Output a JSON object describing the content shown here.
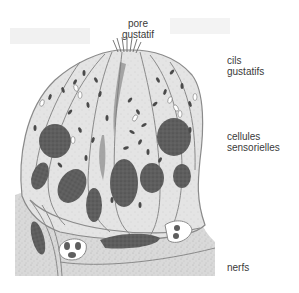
{
  "figure": {
    "colors": {
      "background": "#ffffff",
      "tissue_fill": "#d8d8d8",
      "cell_fill": "#e2e2e2",
      "membrane": "#8a8a8a",
      "nucleus": "#5a5a5a",
      "granule": "#4a4a4a",
      "label_text": "#3a3a3a"
    }
  },
  "labels": {
    "pore": {
      "line1": "pore",
      "line2": "gustatif"
    },
    "cils": {
      "line1": "cils",
      "line2": "gustatifs"
    },
    "cellules": {
      "line1": "cellules",
      "line2": "sensorielles"
    },
    "nerfs": {
      "line1": "nerfs"
    }
  }
}
